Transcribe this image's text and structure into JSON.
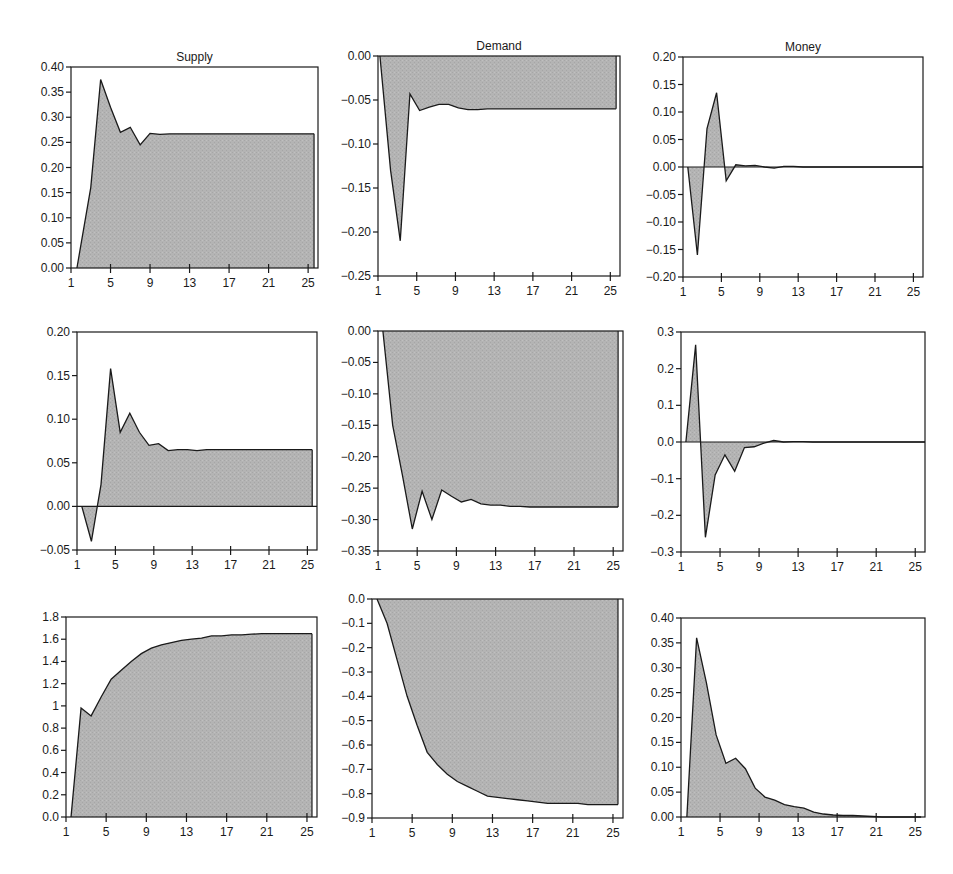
{
  "figure": {
    "column_titles": [
      "Supply",
      "Demand",
      "Money"
    ],
    "fill_color": "#b4b4b4",
    "line_color": "#1a1a1a"
  },
  "chart_data": [
    {
      "type": "area",
      "title": "Supply",
      "row": 1,
      "col": 1,
      "box": [
        71,
        67,
        318,
        268
      ],
      "xlim": [
        1,
        26
      ],
      "ylim": [
        0,
        0.4
      ],
      "x_ticks": [
        1,
        5,
        9,
        13,
        17,
        21,
        25
      ],
      "y_ticks": [
        0.0,
        0.05,
        0.1,
        0.15,
        0.2,
        0.25,
        0.3,
        0.35,
        0.4
      ],
      "y_tick_labels": [
        "0.00",
        "0.05",
        "0.10",
        "0.15",
        "0.20",
        "0.25",
        "0.30",
        "0.35",
        "0.40"
      ],
      "x": [
        1.6,
        3,
        4,
        5,
        6,
        7,
        8,
        9,
        10,
        11,
        12,
        13,
        14,
        15,
        16,
        17,
        18,
        19,
        20,
        21,
        22,
        23,
        24,
        25,
        25.6
      ],
      "values": [
        0,
        0.16,
        0.375,
        0.32,
        0.27,
        0.28,
        0.245,
        0.268,
        0.266,
        0.267,
        0.267,
        0.267,
        0.267,
        0.267,
        0.267,
        0.267,
        0.267,
        0.267,
        0.267,
        0.267,
        0.267,
        0.267,
        0.267,
        0.267,
        0.267
      ]
    },
    {
      "type": "area",
      "title": "Demand",
      "row": 1,
      "col": 2,
      "box": [
        378,
        56,
        620,
        276
      ],
      "xlim": [
        1,
        26
      ],
      "ylim": [
        -0.25,
        0
      ],
      "x_ticks": [
        1,
        5,
        9,
        13,
        17,
        21,
        25
      ],
      "y_ticks": [
        0.0,
        -0.05,
        -0.1,
        -0.15,
        -0.2,
        -0.25
      ],
      "y_tick_labels": [
        "0.00",
        "-0.05",
        "-0.10",
        "-0.15",
        "-0.20",
        "-0.25"
      ],
      "x": [
        1.2,
        2.3,
        3.3,
        4.3,
        5.3,
        6.3,
        7.3,
        8.3,
        9.3,
        10.3,
        11.3,
        12.3,
        13,
        14,
        15,
        16,
        17,
        18,
        19,
        20,
        21,
        22,
        23,
        24,
        25,
        25.6
      ],
      "values": [
        0,
        -0.13,
        -0.21,
        -0.043,
        -0.062,
        -0.058,
        -0.055,
        -0.055,
        -0.059,
        -0.061,
        -0.061,
        -0.06,
        -0.06,
        -0.06,
        -0.06,
        -0.06,
        -0.06,
        -0.06,
        -0.06,
        -0.06,
        -0.06,
        -0.06,
        -0.06,
        -0.06,
        -0.06,
        -0.06
      ]
    },
    {
      "type": "area",
      "title": "Money",
      "row": 1,
      "col": 3,
      "box": [
        683,
        57,
        923,
        277
      ],
      "xlim": [
        1,
        26
      ],
      "ylim": [
        -0.2,
        0.2
      ],
      "x_ticks": [
        1,
        5,
        9,
        13,
        17,
        21,
        25
      ],
      "y_ticks": [
        0.2,
        0.15,
        0.1,
        0.05,
        0.0,
        -0.05,
        -0.1,
        -0.15,
        -0.2
      ],
      "y_tick_labels": [
        "0.20",
        "0.15",
        "0.10",
        "0.05",
        "0.00",
        "-0.05",
        "-0.10",
        "-0.15",
        "-0.20"
      ],
      "x": [
        1.5,
        2.5,
        3.5,
        4.5,
        5.5,
        6.5,
        7.5,
        8.5,
        9.5,
        10.5,
        11.5,
        12.5,
        13.5,
        14.5,
        15.5,
        16.5,
        17.5,
        18.5,
        19.5,
        20.5,
        21.5,
        22.5,
        23.5,
        24.5,
        25.5,
        26
      ],
      "values": [
        0,
        -0.16,
        0.07,
        0.135,
        -0.025,
        0.004,
        0.002,
        0.003,
        0.0,
        -0.002,
        0.001,
        0.001,
        0.0,
        0,
        0,
        0,
        0,
        0,
        0,
        0,
        0,
        0,
        0,
        0,
        0,
        0
      ]
    },
    {
      "type": "area",
      "title": "",
      "row": 2,
      "col": 1,
      "box": [
        77,
        332,
        317,
        550
      ],
      "xlim": [
        1,
        26
      ],
      "ylim": [
        -0.05,
        0.2
      ],
      "x_ticks": [
        1,
        5,
        9,
        13,
        17,
        21,
        25
      ],
      "y_ticks": [
        0.2,
        0.15,
        0.1,
        0.05,
        0.0,
        -0.05
      ],
      "y_tick_labels": [
        "0.20",
        "0.15",
        "0.10",
        "0.05",
        "0.00",
        "-0.05"
      ],
      "x": [
        1.5,
        2.5,
        3.5,
        4.5,
        5.5,
        6.5,
        7.5,
        8.5,
        9.5,
        10.5,
        11.5,
        12.5,
        13.5,
        14.5,
        15.5,
        16.5,
        17.5,
        18.5,
        19.5,
        20.5,
        21.5,
        22.5,
        23.5,
        24.5,
        25.5
      ],
      "values": [
        0,
        -0.04,
        0.025,
        0.158,
        0.085,
        0.107,
        0.085,
        0.07,
        0.072,
        0.064,
        0.065,
        0.065,
        0.064,
        0.065,
        0.065,
        0.065,
        0.065,
        0.065,
        0.065,
        0.065,
        0.065,
        0.065,
        0.065,
        0.065,
        0.065
      ]
    },
    {
      "type": "area",
      "title": "",
      "row": 2,
      "col": 2,
      "box": [
        378,
        331,
        623,
        551
      ],
      "xlim": [
        1,
        26
      ],
      "ylim": [
        -0.35,
        0
      ],
      "x_ticks": [
        1,
        5,
        9,
        13,
        17,
        21,
        25
      ],
      "y_ticks": [
        0.0,
        -0.05,
        -0.1,
        -0.15,
        -0.2,
        -0.25,
        -0.3,
        -0.35
      ],
      "y_tick_labels": [
        "0.00",
        "-0.05",
        "-0.10",
        "-0.15",
        "-0.20",
        "-0.25",
        "-0.30",
        "-0.35"
      ],
      "x": [
        1.5,
        2.5,
        3.5,
        4.5,
        5.5,
        6.5,
        7.5,
        8.5,
        9.5,
        10.5,
        11.5,
        12.5,
        13.5,
        14.5,
        15.5,
        16.5,
        17.5,
        18.5,
        19.5,
        20.5,
        21.5,
        22.5,
        23.5,
        24.5,
        25.5
      ],
      "values": [
        0,
        -0.15,
        -0.23,
        -0.315,
        -0.255,
        -0.3,
        -0.253,
        -0.263,
        -0.272,
        -0.268,
        -0.275,
        -0.277,
        -0.277,
        -0.279,
        -0.279,
        -0.28,
        -0.28,
        -0.28,
        -0.28,
        -0.28,
        -0.28,
        -0.28,
        -0.28,
        -0.28,
        -0.28
      ]
    },
    {
      "type": "area",
      "title": "",
      "row": 2,
      "col": 3,
      "box": [
        681,
        332,
        925,
        552
      ],
      "xlim": [
        1,
        26
      ],
      "ylim": [
        -0.3,
        0.3
      ],
      "x_ticks": [
        1,
        5,
        9,
        13,
        17,
        21,
        25
      ],
      "y_ticks": [
        0.3,
        0.2,
        0.1,
        0.0,
        -0.1,
        -0.2,
        -0.3
      ],
      "y_tick_labels": [
        "0.3",
        "0.2",
        "0.1",
        "0.0",
        "-0.1",
        "-0.2",
        "-0.3"
      ],
      "x": [
        1.5,
        2.5,
        3.5,
        4.5,
        5.5,
        6.5,
        7.5,
        8.5,
        9.5,
        10.5,
        11.5,
        12.5,
        13.5,
        14.5,
        15.5,
        16.5,
        17.5,
        18.5,
        19.5,
        20.5,
        21.5,
        22.5,
        23.5,
        24.5,
        25.5,
        26
      ],
      "values": [
        0,
        0.265,
        -0.26,
        -0.09,
        -0.035,
        -0.08,
        -0.015,
        -0.013,
        -0.003,
        0.004,
        0.0,
        0.001,
        0.001,
        0.0,
        0,
        0,
        0,
        0,
        0,
        0,
        0,
        0,
        0,
        0,
        0,
        0
      ]
    },
    {
      "type": "area",
      "title": "",
      "row": 3,
      "col": 1,
      "box": [
        66,
        617,
        317,
        817
      ],
      "xlim": [
        1,
        26
      ],
      "ylim": [
        0,
        1.8
      ],
      "x_ticks": [
        1,
        5,
        9,
        13,
        17,
        21,
        25
      ],
      "y_ticks": [
        1.8,
        1.6,
        1.4,
        1.2,
        1.0,
        0.8,
        0.6,
        0.4,
        0.2,
        0.0
      ],
      "y_tick_labels": [
        "1.8",
        "1.6",
        "1.4",
        "1.2",
        "1",
        "0.8",
        "0.6",
        "0.4",
        "0.2",
        "0.0"
      ],
      "x": [
        1.5,
        2.5,
        3.5,
        4.5,
        5.5,
        6.5,
        7.5,
        8.5,
        9.5,
        10.5,
        11.5,
        12.5,
        13.5,
        14.5,
        15.5,
        16.5,
        17.5,
        18.5,
        19.5,
        20.5,
        21.5,
        22.5,
        23.5,
        24.5,
        25.5
      ],
      "values": [
        0,
        0.98,
        0.91,
        1.08,
        1.24,
        1.32,
        1.4,
        1.47,
        1.52,
        1.55,
        1.57,
        1.59,
        1.6,
        1.61,
        1.63,
        1.63,
        1.64,
        1.64,
        1.645,
        1.65,
        1.65,
        1.65,
        1.65,
        1.65,
        1.65
      ]
    },
    {
      "type": "area",
      "title": "",
      "row": 3,
      "col": 2,
      "box": [
        372,
        599,
        623,
        818
      ],
      "xlim": [
        1,
        26
      ],
      "ylim": [
        -0.9,
        0
      ],
      "x_ticks": [
        1,
        5,
        9,
        13,
        17,
        21,
        25
      ],
      "y_ticks": [
        0.0,
        -0.1,
        -0.2,
        -0.3,
        -0.4,
        -0.5,
        -0.6,
        -0.7,
        -0.8,
        -0.9
      ],
      "y_tick_labels": [
        "0.0",
        "-0.1",
        "-0.2",
        "-0.3",
        "-0.4",
        "-0.5",
        "-0.6",
        "-0.7",
        "-0.8",
        "-0.9"
      ],
      "x": [
        1.5,
        2.5,
        3.5,
        4.5,
        5.5,
        6.5,
        7.5,
        8.5,
        9.5,
        10.5,
        11.5,
        12.5,
        13.5,
        14.5,
        15.5,
        16.5,
        17.5,
        18.5,
        19.5,
        20.5,
        21.5,
        22.5,
        23.5,
        24.5,
        25.5
      ],
      "values": [
        0,
        -0.1,
        -0.25,
        -0.4,
        -0.52,
        -0.63,
        -0.68,
        -0.72,
        -0.75,
        -0.77,
        -0.79,
        -0.81,
        -0.815,
        -0.82,
        -0.825,
        -0.83,
        -0.835,
        -0.84,
        -0.84,
        -0.84,
        -0.84,
        -0.845,
        -0.845,
        -0.845,
        -0.845
      ]
    },
    {
      "type": "area",
      "title": "",
      "row": 3,
      "col": 3,
      "box": [
        681,
        618,
        925,
        817
      ],
      "xlim": [
        1,
        26
      ],
      "ylim": [
        0,
        0.4
      ],
      "x_ticks": [
        1,
        5,
        9,
        13,
        17,
        21,
        25
      ],
      "y_ticks": [
        0.4,
        0.35,
        0.3,
        0.25,
        0.2,
        0.15,
        0.1,
        0.05,
        0.0
      ],
      "y_tick_labels": [
        "0.40",
        "0.35",
        "0.30",
        "0.25",
        "0.20",
        "0.15",
        "0.10",
        "0.05",
        "0.00"
      ],
      "x": [
        1.6,
        2.6,
        3.6,
        4.6,
        5.6,
        6.6,
        7.6,
        8.6,
        9.6,
        10.6,
        11.6,
        12.6,
        13.6,
        14.6,
        15.6,
        16.6,
        17.6,
        18.6,
        19.6,
        20.6,
        21.6,
        22.6,
        23.6,
        24.6,
        25.6
      ],
      "values": [
        0,
        0.36,
        0.27,
        0.165,
        0.108,
        0.118,
        0.097,
        0.058,
        0.04,
        0.034,
        0.025,
        0.021,
        0.018,
        0.01,
        0.006,
        0.004,
        0.003,
        0.003,
        0.002,
        0.001,
        0.0,
        0.0,
        0.0,
        0.0,
        0.0
      ]
    }
  ]
}
